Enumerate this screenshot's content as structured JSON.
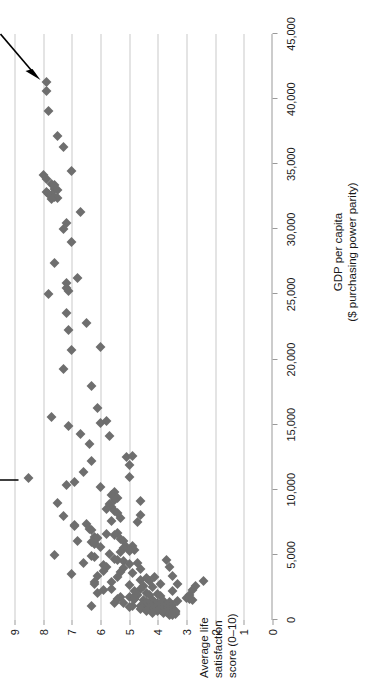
{
  "chart_data": {
    "type": "scatter",
    "title": "",
    "xlabel": "GDP per capita ($ purchasing power parity)",
    "xlabel_line1": "GDP per capita",
    "xlabel_line2": "($ purchasing power parity)",
    "ylabel": "Average life satisfaction score (0–10)",
    "ylabel_line1": "Average life",
    "ylabel_line2": "satisfaction",
    "ylabel_line3": "score (0–10)",
    "xlim": [
      0,
      45000
    ],
    "ylim": [
      0,
      9
    ],
    "xticks": [
      0,
      5000,
      10000,
      15000,
      20000,
      25000,
      30000,
      35000,
      40000,
      45000
    ],
    "xticklabels": [
      "0",
      "5,000",
      "10,000",
      "15,000",
      "20,000",
      "25,000",
      "30,000",
      "35,000",
      "40,000",
      "45,000"
    ],
    "yticks": [
      0,
      1,
      2,
      3,
      4,
      5,
      6,
      7,
      8,
      9
    ],
    "yticklabels": [
      "0",
      "1",
      "2",
      "3",
      "4",
      "5",
      "6",
      "7",
      "8",
      "9"
    ],
    "grid": "horizontal",
    "legend": "none",
    "marker": {
      "shape": "diamond",
      "color": "#6e6e6e",
      "size": 7
    },
    "gridline_color": "#c9c9c9",
    "axis_color": "#9a9a9a",
    "annotations": [
      {
        "label": "US",
        "x": 41300,
        "y": 7.9,
        "arrow": "points down-left to marker"
      },
      {
        "label": "Costa Rica",
        "x": 10900,
        "y": 8.5,
        "arrow": "points down to marker"
      }
    ],
    "points": [
      [
        41300,
        7.9
      ],
      [
        40600,
        7.9
      ],
      [
        39100,
        7.8
      ],
      [
        37200,
        7.5
      ],
      [
        36300,
        7.3
      ],
      [
        34500,
        7.0
      ],
      [
        34200,
        8.0
      ],
      [
        33900,
        7.9
      ],
      [
        33500,
        7.7
      ],
      [
        33400,
        7.6
      ],
      [
        33100,
        7.6
      ],
      [
        33000,
        7.5
      ],
      [
        32900,
        7.9
      ],
      [
        32700,
        7.8
      ],
      [
        32600,
        7.7
      ],
      [
        32500,
        7.6
      ],
      [
        32400,
        7.5
      ],
      [
        32300,
        7.7
      ],
      [
        31300,
        6.7
      ],
      [
        30500,
        7.2
      ],
      [
        30000,
        7.3
      ],
      [
        29000,
        7.0
      ],
      [
        27400,
        7.6
      ],
      [
        26300,
        6.8
      ],
      [
        25900,
        7.2
      ],
      [
        25500,
        7.2
      ],
      [
        25300,
        7.1
      ],
      [
        25000,
        7.8
      ],
      [
        23600,
        7.2
      ],
      [
        22800,
        6.5
      ],
      [
        22300,
        7.1
      ],
      [
        21000,
        6.0
      ],
      [
        20700,
        7.0
      ],
      [
        19300,
        7.3
      ],
      [
        18000,
        6.3
      ],
      [
        16300,
        6.1
      ],
      [
        15600,
        7.7
      ],
      [
        15300,
        5.8
      ],
      [
        15100,
        6.0
      ],
      [
        14900,
        7.1
      ],
      [
        14300,
        6.7
      ],
      [
        14100,
        5.7
      ],
      [
        13500,
        6.4
      ],
      [
        12500,
        5.1
      ],
      [
        12200,
        6.3
      ],
      [
        11900,
        5.0
      ],
      [
        11400,
        6.6
      ],
      [
        10900,
        8.5
      ],
      [
        10600,
        6.9
      ],
      [
        10400,
        7.2
      ],
      [
        10200,
        6.0
      ],
      [
        9800,
        5.5
      ],
      [
        9600,
        5.6
      ],
      [
        9400,
        5.4
      ],
      [
        9200,
        5.5
      ],
      [
        9000,
        7.5
      ],
      [
        8900,
        5.7
      ],
      [
        8700,
        5.6
      ],
      [
        8500,
        5.8
      ],
      [
        8400,
        5.5
      ],
      [
        8200,
        5.4
      ],
      [
        8100,
        4.6
      ],
      [
        8000,
        7.3
      ],
      [
        7800,
        5.3
      ],
      [
        7600,
        5.6
      ],
      [
        7400,
        6.5
      ],
      [
        7300,
        6.9
      ],
      [
        7200,
        6.9
      ],
      [
        7000,
        6.4
      ],
      [
        6900,
        6.3
      ],
      [
        6700,
        5.4
      ],
      [
        6600,
        5.8
      ],
      [
        6500,
        5.5
      ],
      [
        6400,
        6.2
      ],
      [
        6300,
        6.1
      ],
      [
        6200,
        5.3
      ],
      [
        6100,
        5.2
      ],
      [
        6000,
        6.3
      ],
      [
        5900,
        6.2
      ],
      [
        5800,
        6.2
      ],
      [
        5700,
        4.9
      ],
      [
        5600,
        5.1
      ],
      [
        5500,
        5.2
      ],
      [
        5400,
        4.8
      ],
      [
        5300,
        5.0
      ],
      [
        5200,
        5.3
      ],
      [
        5100,
        5.7
      ],
      [
        5000,
        7.6
      ],
      [
        4900,
        6.3
      ],
      [
        4800,
        6.2
      ],
      [
        4700,
        5.5
      ],
      [
        4600,
        5.4
      ],
      [
        4500,
        5.2
      ],
      [
        4400,
        4.7
      ],
      [
        4300,
        5.0
      ],
      [
        4200,
        5.9
      ],
      [
        4100,
        5.8
      ],
      [
        4000,
        5.2
      ],
      [
        3900,
        4.6
      ],
      [
        3800,
        5.9
      ],
      [
        3700,
        5.3
      ],
      [
        3600,
        4.9
      ],
      [
        3500,
        7.0
      ],
      [
        3400,
        6.1
      ],
      [
        3300,
        5.4
      ],
      [
        3200,
        4.4
      ],
      [
        3100,
        4.6
      ],
      [
        3000,
        4.3
      ],
      [
        2900,
        6.2
      ],
      [
        2800,
        6.2
      ],
      [
        2700,
        5.0
      ],
      [
        2600,
        4.5
      ],
      [
        2500,
        4.2
      ],
      [
        2400,
        4.6
      ],
      [
        2300,
        5.9
      ],
      [
        2200,
        4.8
      ],
      [
        2100,
        4.4
      ],
      [
        2000,
        4.0
      ],
      [
        1950,
        4.3
      ],
      [
        1900,
        4.7
      ],
      [
        1850,
        3.9
      ],
      [
        1800,
        5.3
      ],
      [
        1750,
        5.0
      ],
      [
        1700,
        4.9
      ],
      [
        1650,
        4.8
      ],
      [
        1600,
        4.8
      ],
      [
        1550,
        4.5
      ],
      [
        1500,
        4.2
      ],
      [
        1450,
        3.8
      ],
      [
        1400,
        4.1
      ],
      [
        1380,
        4.4
      ],
      [
        1350,
        3.6
      ],
      [
        1300,
        5.2
      ],
      [
        1280,
        4.0
      ],
      [
        1250,
        3.9
      ],
      [
        1200,
        4.3
      ],
      [
        1180,
        4.5
      ],
      [
        1150,
        3.7
      ],
      [
        1120,
        3.5
      ],
      [
        1100,
        4.9
      ],
      [
        1080,
        4.6
      ],
      [
        1050,
        4.0
      ],
      [
        1020,
        3.8
      ],
      [
        1000,
        3.6
      ],
      [
        980,
        5.0
      ],
      [
        950,
        4.3
      ],
      [
        920,
        4.1
      ],
      [
        900,
        3.9
      ],
      [
        880,
        3.7
      ],
      [
        850,
        3.5
      ],
      [
        820,
        4.6
      ],
      [
        800,
        4.2
      ],
      [
        780,
        3.9
      ],
      [
        750,
        3.6
      ],
      [
        720,
        3.4
      ],
      [
        700,
        4.4
      ],
      [
        680,
        4.0
      ],
      [
        650,
        3.7
      ],
      [
        620,
        3.5
      ],
      [
        600,
        3.6
      ],
      [
        580,
        3.4
      ],
      [
        550,
        4.2
      ],
      [
        520,
        3.8
      ],
      [
        500,
        3.5
      ],
      [
        480,
        3.6
      ],
      [
        450,
        3.4
      ],
      [
        420,
        3.6
      ],
      [
        400,
        3.5
      ],
      [
        1900,
        2.9
      ],
      [
        1700,
        3.0
      ],
      [
        1600,
        2.9
      ],
      [
        1500,
        2.8
      ],
      [
        2300,
        2.8
      ],
      [
        2600,
        2.7
      ],
      [
        3000,
        2.4
      ],
      [
        1100,
        6.3
      ],
      [
        2050,
        6.1
      ],
      [
        4350,
        6.6
      ],
      [
        6050,
        6.8
      ],
      [
        2750,
        3.9
      ],
      [
        3300,
        4.1
      ],
      [
        9100,
        4.6
      ],
      [
        7500,
        4.7
      ],
      [
        12600,
        4.9
      ],
      [
        11000,
        5.0
      ],
      [
        5600,
        6.0
      ],
      [
        2900,
        5.6
      ],
      [
        2400,
        5.6
      ],
      [
        1300,
        5.5
      ],
      [
        1600,
        5.4
      ],
      [
        3400,
        3.5
      ],
      [
        2200,
        3.5
      ],
      [
        4050,
        3.6
      ],
      [
        4600,
        3.7
      ],
      [
        1450,
        3.3
      ],
      [
        2750,
        3.3
      ]
    ]
  },
  "axes": {
    "x_title_line1": "GDP per capita",
    "x_title_line2": "($ purchasing power parity)",
    "y_title_line1": "Average life",
    "y_title_line2": "satisfaction",
    "y_title_line3": "score (0–10)"
  },
  "annotations": {
    "us_label": "US",
    "costa_rica_label": "Costa Rica"
  }
}
